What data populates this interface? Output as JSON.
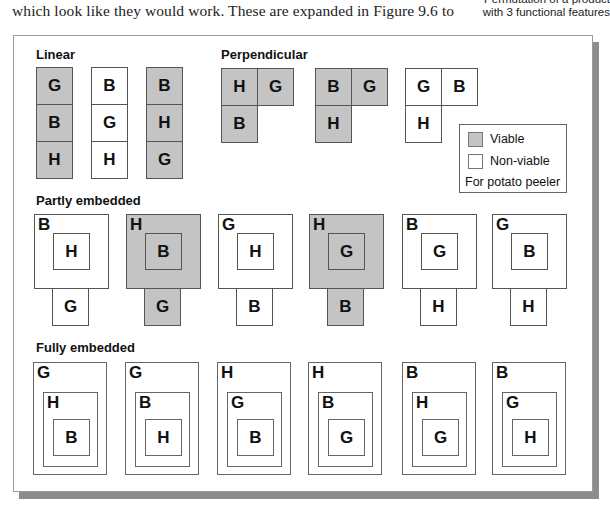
{
  "page": {
    "body_text": "which look like they would work.  These are expanded in Figure 9.6 to",
    "caption_lines": [
      "Permutation of a product",
      "with 3 functional features"
    ]
  },
  "figure": {
    "colors": {
      "viable": "#c4c4c4",
      "non_viable": "#ffffff",
      "border": "#555555"
    },
    "sections": {
      "linear": {
        "title": "Linear",
        "items": [
          {
            "cells": [
              "G",
              "B",
              "H"
            ],
            "viable": true
          },
          {
            "cells": [
              "B",
              "G",
              "H"
            ],
            "viable": false
          },
          {
            "cells": [
              "B",
              "H",
              "G"
            ],
            "viable": true
          }
        ]
      },
      "perpendicular": {
        "title": "Perpendicular",
        "items": [
          {
            "top_left": "H",
            "top_right": "G",
            "bottom": "B",
            "viable": true
          },
          {
            "top_left": "B",
            "top_right": "G",
            "bottom": "H",
            "viable": true
          },
          {
            "top_left": "G",
            "top_right": "B",
            "bottom": "H",
            "viable": false
          }
        ]
      },
      "partly_embedded": {
        "title": "Partly embedded",
        "items": [
          {
            "outer": "B",
            "inner": "H",
            "attached": "G",
            "viable": false
          },
          {
            "outer": "H",
            "inner": "B",
            "attached": "G",
            "viable": true
          },
          {
            "outer": "G",
            "inner": "H",
            "attached": "B",
            "viable": false
          },
          {
            "outer": "H",
            "inner": "G",
            "attached": "B",
            "viable": true
          },
          {
            "outer": "B",
            "inner": "G",
            "attached": "H",
            "viable": false
          },
          {
            "outer": "G",
            "inner": "B",
            "attached": "H",
            "viable": false
          }
        ]
      },
      "fully_embedded": {
        "title": "Fully embedded",
        "items": [
          {
            "outer": "G",
            "middle": "H",
            "inner": "B",
            "viable": false
          },
          {
            "outer": "G",
            "middle": "B",
            "inner": "H",
            "viable": false
          },
          {
            "outer": "H",
            "middle": "G",
            "inner": "B",
            "viable": false
          },
          {
            "outer": "H",
            "middle": "B",
            "inner": "G",
            "viable": false
          },
          {
            "outer": "B",
            "middle": "H",
            "inner": "G",
            "viable": false
          },
          {
            "outer": "B",
            "middle": "G",
            "inner": "H",
            "viable": false
          }
        ]
      }
    },
    "legend": {
      "viable_label": "Viable",
      "non_viable_label": "Non-viable",
      "note": "For potato peeler"
    }
  }
}
